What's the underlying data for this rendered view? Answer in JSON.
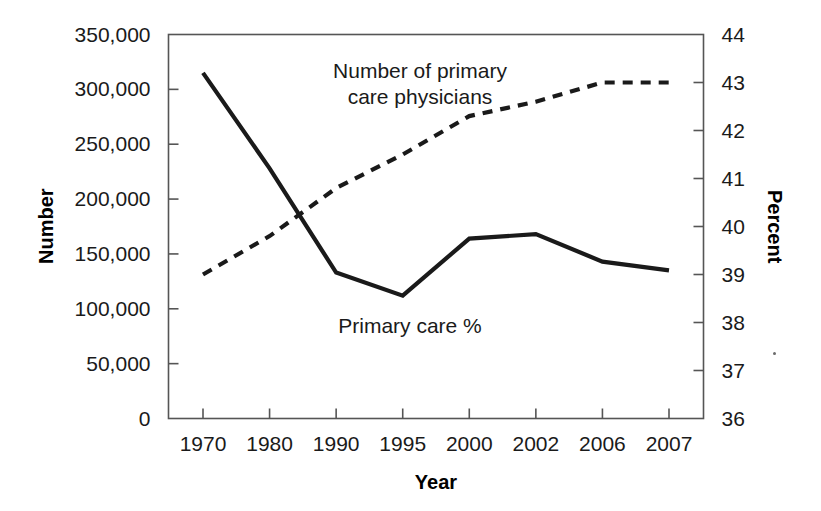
{
  "chart_data": {
    "type": "line",
    "title": "",
    "xlabel": "Year",
    "ylabel": "Number",
    "y2label": "Percent",
    "categories": [
      "1970",
      "1980",
      "1990",
      "1995",
      "2000",
      "2002",
      "2006",
      "2007"
    ],
    "grid": false,
    "legend_position": "inline-annotations",
    "axes": {
      "left": {
        "label": "Number",
        "ylim": [
          0,
          350000
        ],
        "ticks": [
          0,
          50000,
          100000,
          150000,
          200000,
          250000,
          300000,
          350000
        ],
        "tick_labels": [
          "0",
          "50,000",
          "100,000",
          "150,000",
          "200,000",
          "250,000",
          "300,000",
          "350,000"
        ]
      },
      "right": {
        "label": "Percent",
        "ylim": [
          36,
          44
        ],
        "ticks": [
          36,
          37,
          38,
          39,
          40,
          41,
          42,
          43,
          44
        ],
        "tick_labels": [
          "36",
          "37",
          "38",
          "39",
          "40",
          "41",
          "42",
          "43",
          "44"
        ]
      },
      "x": {
        "label": "Year",
        "tick_labels": [
          "1970",
          "1980",
          "1990",
          "1995",
          "2000",
          "2002",
          "2006",
          "2007"
        ]
      }
    },
    "series": [
      {
        "name": "Number of primary care physicians",
        "axis": "left",
        "style": "solid",
        "color": "#1a1a1a",
        "annotation": "Number of primary\ncare physicians",
        "values": [
          315000,
          228000,
          133000,
          112000,
          164000,
          168000,
          143000,
          135000
        ]
      },
      {
        "name": "Primary care %",
        "axis": "right",
        "style": "dashed",
        "color": "#1a1a1a",
        "annotation": "Primary care %",
        "values": [
          39.0,
          39.8,
          40.8,
          41.5,
          42.3,
          42.6,
          43.0,
          43.0
        ]
      }
    ]
  },
  "annotations": {
    "series1_label": "Number of primary\ncare physicians",
    "series2_label": "Primary care %"
  },
  "colors": {
    "line": "#1a1a1a",
    "axis": "#555555",
    "text": "#1a1a1a",
    "background": "#ffffff"
  }
}
